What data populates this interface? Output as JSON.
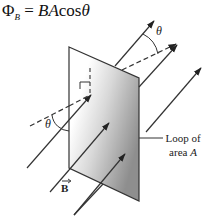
{
  "formula": {
    "lhs": "Φ",
    "lhs_sub": "B",
    "equals": " = ",
    "rhs_vars": "BA",
    "rhs_func": "cos",
    "rhs_angle": "θ"
  },
  "labels": {
    "theta_top": "θ",
    "theta_left": "θ",
    "loop_line1": "Loop of",
    "loop_line2_prefix": "area ",
    "loop_line2_var": "A",
    "field_vector": "B"
  },
  "colors": {
    "stroke": "#333333",
    "plate_light": "#ffffff",
    "plate_dark": "#9a9a9a"
  }
}
